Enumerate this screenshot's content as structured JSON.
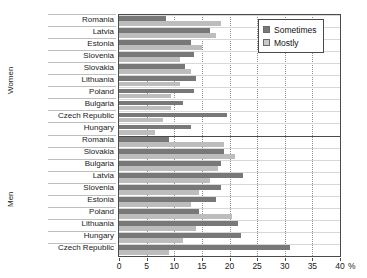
{
  "title": "",
  "legend": {
    "position": "top-right-inside-plot",
    "items": [
      {
        "label": "Sometimes",
        "color": "#787878"
      },
      {
        "label": "Mostly",
        "color": "#c9c9c9"
      }
    ]
  },
  "axis": {
    "unit": "%",
    "ticks": [
      "0",
      "5",
      "10",
      "15",
      "20",
      "25",
      "30",
      "35",
      "40"
    ],
    "min": 0,
    "max": 40
  },
  "panels": [
    {
      "name": "Women"
    },
    {
      "name": "Men"
    }
  ],
  "chart_data": {
    "type": "bar",
    "orientation": "horizontal",
    "title": "",
    "xlabel": "%",
    "ylabel": "",
    "xlim": [
      0,
      40
    ],
    "grid": "vertical-dotted",
    "legend_position": "top-right",
    "series_names": [
      "Sometimes",
      "Mostly"
    ],
    "panels": [
      {
        "name": "Women",
        "categories": [
          "Romania",
          "Latvia",
          "Estonia",
          "Slovenia",
          "Slovakia",
          "Lithuania",
          "Poland",
          "Bulgaria",
          "Czech Republic",
          "Hungary"
        ],
        "series": [
          {
            "name": "Sometimes",
            "values": [
              8.5,
              16.5,
              13.0,
              13.5,
              12.0,
              14.0,
              13.5,
              11.5,
              19.5,
              13.0
            ]
          },
          {
            "name": "Mostly",
            "values": [
              18.5,
              17.5,
              15.0,
              11.0,
              13.0,
              11.0,
              9.5,
              9.5,
              8.0,
              6.5
            ]
          }
        ]
      },
      {
        "name": "Men",
        "categories": [
          "Romania",
          "Slovakia",
          "Bulgaria",
          "Latvia",
          "Slovenia",
          "Estonia",
          "Poland",
          "Lithuania",
          "Hungary",
          "Czech Republic"
        ],
        "series": [
          {
            "name": "Sometimes",
            "values": [
              9.0,
              19.0,
              18.5,
              22.5,
              18.5,
              17.5,
              14.5,
              21.5,
              22.0,
              31.0
            ]
          },
          {
            "name": "Mostly",
            "values": [
              19.0,
              21.0,
              18.0,
              16.5,
              14.5,
              13.0,
              20.5,
              14.0,
              11.5,
              9.0
            ]
          }
        ]
      }
    ]
  }
}
